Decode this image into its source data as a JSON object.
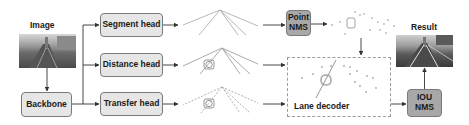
{
  "input": {
    "label": "Image"
  },
  "output": {
    "label": "Result"
  },
  "nodes": {
    "backbone": "Backbone",
    "segment_head": "Segment head",
    "distance_head": "Distance head",
    "transfer_head": "Transfer head",
    "point_nms": "Point NMS",
    "lane_decoder": "Lane decoder",
    "iou_nms": "IOU NMS"
  },
  "colors": {
    "box_fill": "#e6e6e6",
    "nms_fill": "#a8a8a8",
    "border": "#7a7a7a",
    "arrow": "#333333"
  }
}
